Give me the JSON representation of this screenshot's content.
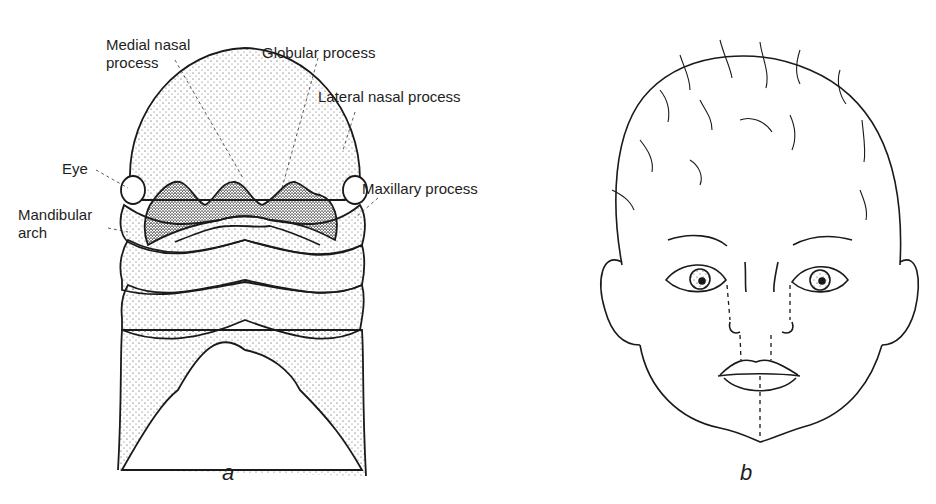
{
  "figure": {
    "panel_a": {
      "letter": "a",
      "labels": {
        "medial_nasal_1": "Medial nasal",
        "medial_nasal_2": "process",
        "globular": "Globular process",
        "lateral_nasal": "Lateral nasal process",
        "eye": "Eye",
        "maxillary": "Maxillary process",
        "mandibular_1": "Mandibular",
        "mandibular_2": "arch"
      }
    },
    "panel_b": {
      "letter": "b"
    },
    "colors": {
      "ink": "#1a1a1a",
      "background": "#ffffff"
    }
  }
}
